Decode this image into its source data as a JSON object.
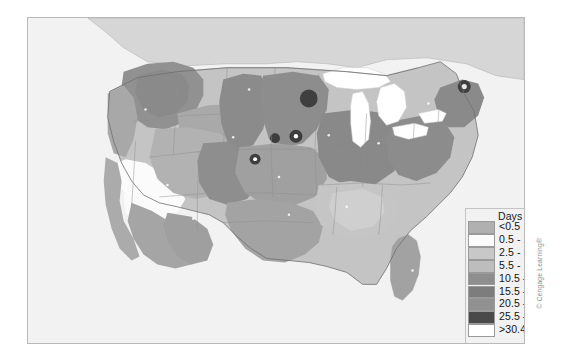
{
  "figure": {
    "kind": "choropleth-map",
    "region": "Contiguous United States and southern Canada",
    "background_color": "#ffffff",
    "map_background_color": "#f2f2f2",
    "map_border_color": "#b9b9b9"
  },
  "legend": {
    "title": "Days",
    "background_color": "#f2f2f2",
    "border_color": "#c3c3c3",
    "entries": [
      {
        "label": "<0.5",
        "color": "#b0b0b0"
      },
      {
        "label": "0.5 - 2.4",
        "color": "#fbfbfb"
      },
      {
        "label": "2.5 - 5.4",
        "color": "#c8c8c8"
      },
      {
        "label": "5.5 - 10.4",
        "color": "#bdbdbd"
      },
      {
        "label": "10.5 - 15.4",
        "color": "#8e8e8e"
      },
      {
        "label": "15.5 - 20.4",
        "color": "#7d7d7d"
      },
      {
        "label": "20.5 - 25.4",
        "color": "#919191"
      },
      {
        "label": "25.5 - 30.4",
        "color": "#4a4a4a"
      },
      {
        "label": ">30.4",
        "color": "#ffffff"
      }
    ]
  },
  "credit": {
    "text": "© Cengage Learning®"
  },
  "chart_data": {
    "type": "heatmap",
    "title": "Days",
    "xlabel": "",
    "ylabel": "",
    "classes": [
      {
        "label": "<0.5",
        "min": 0,
        "max": 0.5,
        "color": "#b0b0b0"
      },
      {
        "label": "0.5 - 2.4",
        "min": 0.5,
        "max": 2.4,
        "color": "#fbfbfb"
      },
      {
        "label": "2.5 - 5.4",
        "min": 2.5,
        "max": 5.4,
        "color": "#c8c8c8"
      },
      {
        "label": "5.5 - 10.4",
        "min": 5.5,
        "max": 10.4,
        "color": "#bdbdbd"
      },
      {
        "label": "10.5 - 15.4",
        "min": 10.5,
        "max": 15.4,
        "color": "#8e8e8e"
      },
      {
        "label": "15.5 - 20.4",
        "min": 15.5,
        "max": 20.4,
        "color": "#7d7d7d"
      },
      {
        "label": "20.5 - 25.4",
        "min": 20.5,
        "max": 25.4,
        "color": "#919191"
      },
      {
        "label": "25.5 - 30.4",
        "min": 25.5,
        "max": 30.4,
        "color": "#4a4a4a"
      },
      {
        "label": ">30.4",
        "min": 30.4,
        "max": null,
        "color": "#ffffff"
      }
    ],
    "regions": [
      {
        "name": "Pacific Northwest interior (eastern Washington / Idaho panhandle)",
        "class": "20.5 - 25.4"
      },
      {
        "name": "Cascades and coastal Oregon / Washington",
        "class": "10.5 - 15.4"
      },
      {
        "name": "Northern California coast",
        "class": "10.5 - 15.4"
      },
      {
        "name": "Nevada / western Utah basin band",
        "class": "0.5 - 2.4"
      },
      {
        "name": "Southern California and Arizona desert",
        "class": "10.5 - 15.4"
      },
      {
        "name": "Northern Rockies / Montana",
        "class": "10.5 - 15.4"
      },
      {
        "name": "Dakotas western belt",
        "class": "15.5 - 20.4"
      },
      {
        "name": "Minnesota dark core",
        "class": "25.5 - 30.4"
      },
      {
        "name": "Iowa / eastern Nebraska dark core",
        "class": "25.5 - 30.4"
      },
      {
        "name": "Central Plains (Kansas / Nebraska)",
        "class": "10.5 - 15.4"
      },
      {
        "name": "Texas panhandle and central Texas",
        "class": "10.5 - 15.4"
      },
      {
        "name": "Great Lakes water bodies",
        "class": ">30.4"
      },
      {
        "name": "Lower Great Lakes states (Ohio / Indiana / Illinois)",
        "class": "15.5 - 20.4"
      },
      {
        "name": "Appalachians / mid-Atlantic",
        "class": "15.5 - 20.4"
      },
      {
        "name": "Deep South (Mississippi / Alabama / Georgia)",
        "class": "5.5 - 10.4"
      },
      {
        "name": "Florida peninsula",
        "class": "10.5 - 15.4"
      },
      {
        "name": "New England / Maine",
        "class": "15.5 - 20.4"
      },
      {
        "name": "Maine dark core",
        "class": "25.5 - 30.4"
      },
      {
        "name": "Southern Canada (Ontario / Quebec)",
        "class": "<0.5"
      },
      {
        "name": "Ocean and Gulf of Mexico",
        "class": ">30.4"
      }
    ]
  }
}
